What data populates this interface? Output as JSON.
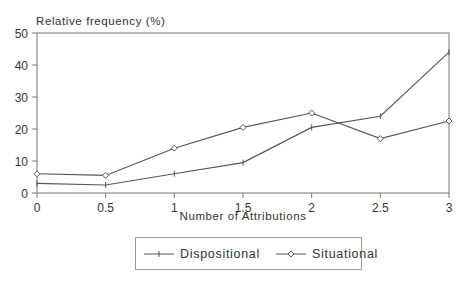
{
  "chart_data": {
    "type": "line",
    "title": "",
    "ylabel": "Relative frequency (%)",
    "xlabel": "Number of Attributions",
    "x": [
      0,
      0.5,
      1,
      1.5,
      2,
      2.5,
      3
    ],
    "x_tick_labels": [
      "0",
      "0.5",
      "1",
      "1.5",
      "2",
      "2.5",
      "3"
    ],
    "y_ticks": [
      0,
      10,
      20,
      30,
      40,
      50
    ],
    "y_tick_labels": [
      "0",
      "10",
      "20",
      "30",
      "40",
      "50"
    ],
    "ylim": [
      0,
      50
    ],
    "xlim": [
      0,
      3
    ],
    "grid": false,
    "legend_position": "bottom-center",
    "series": [
      {
        "name": "Dispositional",
        "marker": "plus",
        "values": [
          3,
          2.5,
          6,
          9.5,
          20.5,
          24,
          44
        ]
      },
      {
        "name": "Situational",
        "marker": "diamond",
        "values": [
          6,
          5.5,
          14,
          20.5,
          25,
          17,
          22.5
        ]
      }
    ]
  },
  "legend": {
    "items": [
      {
        "label": "Dispositional"
      },
      {
        "label": "Situational"
      }
    ]
  },
  "colors": {
    "line": "#555555",
    "axis": "#777777",
    "text": "#333333"
  }
}
